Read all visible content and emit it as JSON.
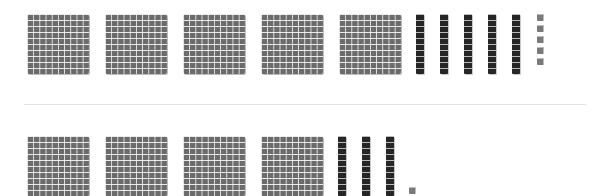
{
  "diagram": {
    "type": "base-ten-blocks",
    "rows": [
      {
        "name": "top",
        "hundreds": 5,
        "tens": 5,
        "ones": 5,
        "value": 555
      },
      {
        "name": "bottom",
        "hundreds": 4,
        "tens": 3,
        "ones": 1,
        "value": 431
      }
    ],
    "colors": {
      "hundred_fill": "#6b6b6b",
      "ten_fill": "#262626",
      "one_fill": "#7a7a7a",
      "grid_line": "#ffffff",
      "divider": "#e2e2e2",
      "background": "#ffffff"
    }
  }
}
